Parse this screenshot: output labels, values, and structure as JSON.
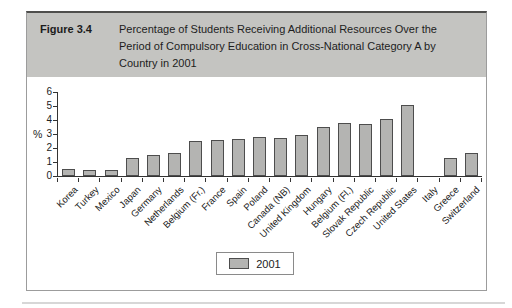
{
  "figure": {
    "label": "Figure 3.4",
    "title_lines": [
      "Percentage of Students Receiving Additional Resources Over the",
      "Period of Compulsory Education in Cross-National Category A by",
      "Country in 2001"
    ]
  },
  "chart_data": {
    "type": "bar",
    "title": "",
    "xlabel": "",
    "ylabel": "%",
    "ylim": [
      0,
      6
    ],
    "yticks": [
      0,
      1,
      2,
      3,
      4,
      5,
      6
    ],
    "grid": false,
    "legend_position": "bottom-center",
    "categories": [
      "Korea",
      "Turkey",
      "Mexico",
      "Japan",
      "Germany",
      "Netherlands",
      "Belgium (Fr.)",
      "France",
      "Spain",
      "Poland",
      "Canada (NB)",
      "United Kingdom",
      "Hungary",
      "Belgium (Fl.)",
      "Slovak Republic",
      "Czech Republic",
      "United States",
      "Italy",
      "Greece",
      "Switzerland"
    ],
    "series": [
      {
        "name": "2001",
        "values": [
          0.5,
          0.45,
          0.45,
          1.3,
          1.5,
          1.65,
          2.5,
          2.55,
          2.65,
          2.8,
          2.75,
          2.9,
          3.5,
          3.8,
          3.75,
          4.05,
          5.1,
          0,
          1.3,
          1.65
        ]
      }
    ],
    "bar_color": "#b4b4b2",
    "bar_border": "#4d4d4d"
  },
  "colors": {
    "header_band": "#c4c4c1",
    "axis": "#333333",
    "figure_border": "#9c9c9c"
  }
}
